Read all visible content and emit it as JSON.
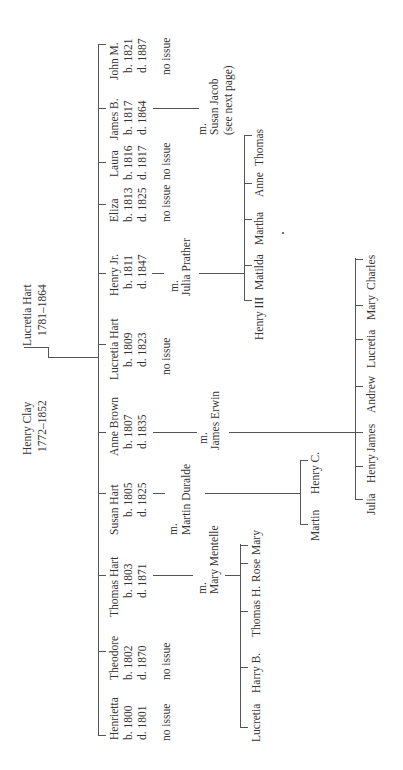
{
  "parents": {
    "father": {
      "name": "Henry Clay",
      "dates": "1772–1852"
    },
    "mother": {
      "name": "Lucretia Hart",
      "dates": "1781–1864"
    }
  },
  "children": [
    {
      "name": "Henrietta",
      "born": "b. 1800",
      "died": "d. 1801",
      "note": "no issue"
    },
    {
      "name": "Theodore",
      "born": "b. 1802",
      "died": "d. 1870",
      "note": "no issue"
    },
    {
      "name": "Thomas Hart",
      "born": "b. 1803",
      "died": "d. 1871",
      "married": "m.",
      "spouse": "Mary Mentelle"
    },
    {
      "name": "Susan Hart",
      "born": "b. 1805",
      "died": "d. 1825",
      "married": "m.",
      "spouse": "Martin Duralde"
    },
    {
      "name": "Anne Brown",
      "born": "b. 1807",
      "died": "d. 1835",
      "married": "m.",
      "spouse": "James Erwin"
    },
    {
      "name": "Lucretia Hart",
      "born": "b. 1809",
      "died": "d. 1823",
      "note": "no issue"
    },
    {
      "name": "Henry Jr.",
      "born": "b. 1811",
      "died": "d. 1847",
      "married": "m.",
      "spouse": "Julia Prather"
    },
    {
      "name": "Eliza",
      "born": "b. 1813",
      "died": "d. 1825",
      "note": "no issue"
    },
    {
      "name": "Laura",
      "born": "b. 1816",
      "died": "d. 1817",
      "note": "no issue"
    },
    {
      "name": "James B.",
      "born": "b. 1817",
      "died": "d. 1864",
      "married": "m.",
      "spouse": "Susan Jacob",
      "spouse_note": "(see  next page)"
    },
    {
      "name": "John M.",
      "born": "b. 1821",
      "died": "d. 1887",
      "note": "no issue"
    }
  ],
  "grandchildren": {
    "thomas": [
      "Lucretia",
      "Harry B.",
      "Thomas H.",
      "Rose",
      "Mary"
    ],
    "susan": [
      "Martin",
      "Henry C."
    ],
    "anne": [
      "Julia",
      "Henry",
      "James",
      "Andrew",
      "Lucretia",
      "Mary",
      "Charles"
    ],
    "henry_jr": [
      "Henry III",
      "Matilda",
      "Martha",
      "Anne",
      "Thomas"
    ]
  }
}
